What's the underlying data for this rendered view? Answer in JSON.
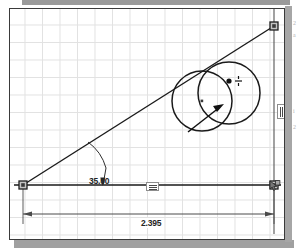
{
  "application": {
    "type": "cad-sketch-canvas",
    "title": "Parametric Sketch"
  },
  "canvas": {
    "grid_visible": true,
    "grid_color": "#e2e2e2",
    "background_color": "#ffffff",
    "border_color": "#3a3a3a"
  },
  "colors": {
    "geometry": "#1a1a1a",
    "dimension": "#242424",
    "grid": "#e2e2e2",
    "node_fill": "#b8b8b8",
    "node_stroke": "#2a2a2a",
    "page_shadow": "#a0a0a0"
  },
  "dimensions": [
    {
      "name": "angle-dimension",
      "label": "35.00",
      "kind": "angular",
      "units": "degrees",
      "value": 35.0
    },
    {
      "name": "length-dimension",
      "label": "2.395",
      "kind": "linear-horizontal",
      "units": "inches",
      "value": 2.395
    }
  ],
  "constraints": [
    {
      "name": "horizontal-constraint",
      "glyph": "horizontal-constraint-icon",
      "applies_to": "baseline"
    },
    {
      "name": "vertical-constraint",
      "glyph": "vertical-constraint-icon",
      "applies_to": "right-edge-line"
    }
  ],
  "cursor": {
    "name": "snap-cursor-icon",
    "glyph": "coincident-snap-cursor",
    "crosshair_visible": true
  },
  "entities": {
    "lines": [
      {
        "name": "baseline-horizontal",
        "from": [
          13,
          176
        ],
        "to": [
          264,
          176
        ]
      },
      {
        "name": "hypotenuse-line",
        "from": [
          13,
          176
        ],
        "to": [
          264,
          17
        ]
      },
      {
        "name": "right-vertical-line",
        "from": [
          264,
          17
        ],
        "to": [
          264,
          176
        ]
      }
    ],
    "circles": [
      {
        "name": "circle-left",
        "cx": 192,
        "cy": 92,
        "r": 30
      },
      {
        "name": "circle-right",
        "cx": 219,
        "cy": 84,
        "r": 31
      }
    ],
    "nodes": [
      {
        "name": "node-origin",
        "x": 13,
        "y": 176,
        "shape": "square"
      },
      {
        "name": "node-apex",
        "x": 264,
        "y": 17,
        "shape": "square"
      },
      {
        "name": "node-corner",
        "x": 264,
        "y": 176,
        "shape": "square"
      }
    ],
    "radius_arrow": {
      "name": "radius-arrow",
      "from": [
        180,
        122
      ],
      "to": [
        212,
        97
      ]
    }
  },
  "margin_text": {
    "fragment_1": "2",
    "fragment_2": "a",
    "fragment_3": "i",
    "fragment_4": "2"
  }
}
